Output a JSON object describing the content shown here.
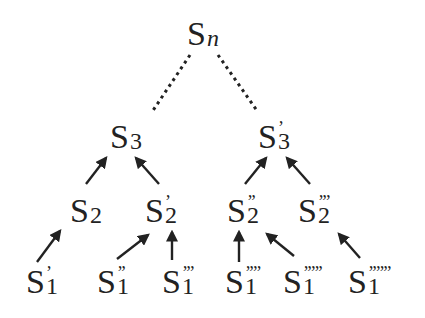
{
  "diagram": {
    "colors": {
      "text": "#222222",
      "arrow": "#222222",
      "dotted": "#222222",
      "background": "#ffffff"
    },
    "nodes": {
      "root": {
        "base": "S",
        "sub": "n",
        "primes": ""
      },
      "s3_left": {
        "base": "S",
        "sub": "3",
        "primes": ""
      },
      "s3_right": {
        "base": "S",
        "sub": "3",
        "primes": "’"
      },
      "s2_a": {
        "base": "S",
        "sub": "2",
        "primes": ""
      },
      "s2_b": {
        "base": "S",
        "sub": "2",
        "primes": "’"
      },
      "s2_c": {
        "base": "S",
        "sub": "2",
        "primes": "’’"
      },
      "s2_d": {
        "base": "S",
        "sub": "2",
        "primes": "’’’"
      },
      "s1_a": {
        "base": "S",
        "sub": "1",
        "primes": "’"
      },
      "s1_b": {
        "base": "S",
        "sub": "1",
        "primes": "’’"
      },
      "s1_c": {
        "base": "S",
        "sub": "1",
        "primes": "’’’"
      },
      "s1_d": {
        "base": "S",
        "sub": "1",
        "primes": "’’’’"
      },
      "s1_e": {
        "base": "S",
        "sub": "1",
        "primes": "’’’’’"
      },
      "s1_f": {
        "base": "S",
        "sub": "1",
        "primes": "’’’’’’"
      }
    },
    "edges": [
      {
        "from": "s3_left",
        "to": "root",
        "style": "dotted"
      },
      {
        "from": "s3_right",
        "to": "root",
        "style": "dotted"
      },
      {
        "from": "s2_a",
        "to": "s3_left",
        "style": "arrow"
      },
      {
        "from": "s2_b",
        "to": "s3_left",
        "style": "arrow"
      },
      {
        "from": "s2_c",
        "to": "s3_right",
        "style": "arrow"
      },
      {
        "from": "s2_d",
        "to": "s3_right",
        "style": "arrow"
      },
      {
        "from": "s1_a",
        "to": "s2_a",
        "style": "arrow"
      },
      {
        "from": "s1_b",
        "to": "s2_b",
        "style": "arrow"
      },
      {
        "from": "s1_c",
        "to": "s2_b",
        "style": "arrow"
      },
      {
        "from": "s1_d",
        "to": "s2_c",
        "style": "arrow"
      },
      {
        "from": "s1_e",
        "to": "s2_c",
        "style": "arrow"
      },
      {
        "from": "s1_f",
        "to": "s2_d",
        "style": "arrow"
      }
    ]
  }
}
